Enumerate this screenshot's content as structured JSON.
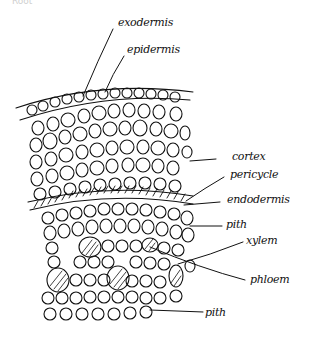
{
  "diagram": {
    "type": "hand-drawn botanical cross-section",
    "top_cutoff_text": "Root",
    "labels": [
      {
        "id": "exodermis",
        "text": "exodermis"
      },
      {
        "id": "epidermis",
        "text": "epidermis"
      },
      {
        "id": "cortex",
        "text": "cortex"
      },
      {
        "id": "pericycle",
        "text": "pericycle"
      },
      {
        "id": "endodermis",
        "text": "endodermis"
      },
      {
        "id": "pith-upper",
        "text": "pith"
      },
      {
        "id": "xylem",
        "text": "xylem"
      },
      {
        "id": "phloem",
        "text": "phloem"
      },
      {
        "id": "pith-lower",
        "text": "pith"
      }
    ],
    "colors": {
      "ink": "#111111",
      "background": "#ffffff"
    }
  }
}
